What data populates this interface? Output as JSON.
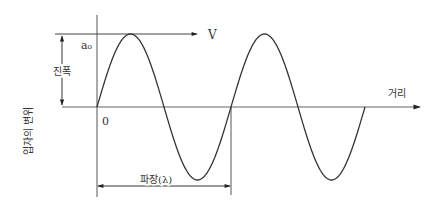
{
  "diagram": {
    "type": "transverse-wave",
    "labels": {
      "velocity": "V",
      "amplitude_symbol": "a₀",
      "amplitude": "진폭",
      "origin": "0",
      "distance_axis": "거리",
      "displacement_axis": "입자의 변위",
      "wavelength": "파장(λ)"
    },
    "geometry": {
      "origin_x": 97,
      "baseline_y": 107,
      "amplitude_px": 73,
      "wavelength_px": 134,
      "cycles": 2
    },
    "colors": {
      "line": "#333333",
      "axis": "#555555",
      "background": "#ffffff"
    }
  }
}
